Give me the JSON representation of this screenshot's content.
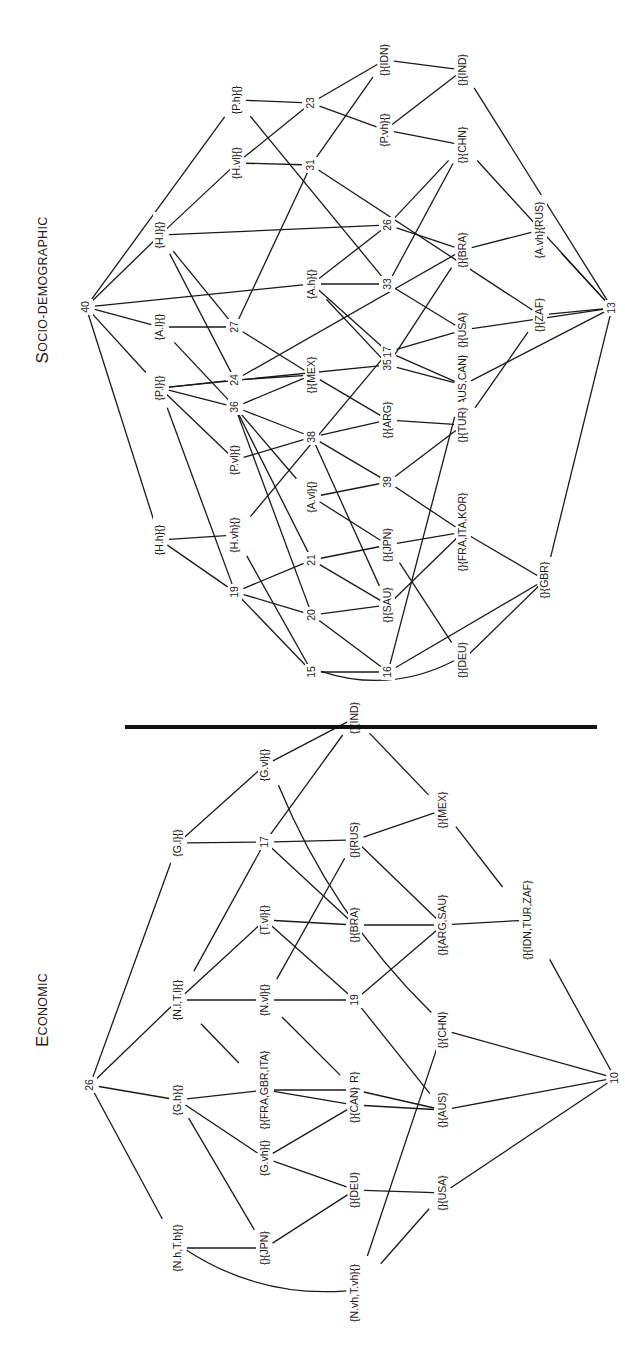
{
  "orientation": "rotated-90-ccw",
  "divider": {
    "x1": 125,
    "y1": 727,
    "x2": 597,
    "y2": 727
  },
  "diagrams": [
    {
      "id": "socio",
      "title": "Socio-demographic",
      "title_pos": [
        44,
        290
      ],
      "nodes": [
        {
          "id": "40",
          "label": "40",
          "x": 86,
          "y": 307
        },
        {
          "id": "Ph",
          "label": "{P.h}{}",
          "x": 237,
          "y": 100
        },
        {
          "id": "Hvl",
          "label": "{H.vl}{}",
          "x": 237,
          "y": 163
        },
        {
          "id": "Hl",
          "label": "{H.l}{}",
          "x": 160,
          "y": 235
        },
        {
          "id": "Al",
          "label": "{A.l}{}",
          "x": 160,
          "y": 327
        },
        {
          "id": "23",
          "label": "23",
          "x": 311,
          "y": 103
        },
        {
          "id": "31",
          "label": "31",
          "x": 311,
          "y": 165
        },
        {
          "id": "27",
          "label": "27",
          "x": 235,
          "y": 327
        },
        {
          "id": "24",
          "label": "24",
          "x": 235,
          "y": 380
        },
        {
          "id": "IDN",
          "label": "{}{IDN}",
          "x": 385,
          "y": 60
        },
        {
          "id": "Pvh",
          "label": "{P.vh}{}",
          "x": 385,
          "y": 130
        },
        {
          "id": "IND",
          "label": "{}{IND}",
          "x": 463,
          "y": 70
        },
        {
          "id": "CHN",
          "label": "{}{CHN}",
          "x": 463,
          "y": 145
        },
        {
          "id": "26",
          "label": "26",
          "x": 388,
          "y": 225
        },
        {
          "id": "Ah",
          "label": "{A.h}{}",
          "x": 312,
          "y": 284
        },
        {
          "id": "33",
          "label": "33",
          "x": 388,
          "y": 284
        },
        {
          "id": "BRA",
          "label": "{}{BRA}",
          "x": 463,
          "y": 250
        },
        {
          "id": "AvhRUS",
          "label": "{A.vh}{RUS}",
          "x": 540,
          "y": 230
        },
        {
          "id": "USA",
          "label": "{}{USA}",
          "x": 463,
          "y": 330
        },
        {
          "id": "ZAF",
          "label": "{}{ZAF}",
          "x": 540,
          "y": 315
        },
        {
          "id": "13",
          "label": "13",
          "x": 612,
          "y": 308
        },
        {
          "id": "MEX",
          "label": "{}{MEX}",
          "x": 312,
          "y": 375
        },
        {
          "id": "35",
          "label": "35",
          "x": 388,
          "y": 365
        },
        {
          "id": "17",
          "label": "17",
          "x": 388,
          "y": 352
        },
        {
          "id": "AUSCAN",
          "label": "{}{AUS,CAN}",
          "x": 463,
          "y": 385
        },
        {
          "id": "Pl",
          "label": "{P.l}{}",
          "x": 160,
          "y": 388
        },
        {
          "id": "36",
          "label": "36",
          "x": 235,
          "y": 407
        },
        {
          "id": "ARG",
          "label": "{}{ARG}",
          "x": 388,
          "y": 420
        },
        {
          "id": "TUR",
          "label": "{}{TUR}",
          "x": 463,
          "y": 425
        },
        {
          "id": "38",
          "label": "38",
          "x": 312,
          "y": 437
        },
        {
          "id": "Pvl",
          "label": "{P.vl}{}",
          "x": 235,
          "y": 460
        },
        {
          "id": "39",
          "label": "39",
          "x": 388,
          "y": 482
        },
        {
          "id": "Avl",
          "label": "{A.vl}{}",
          "x": 312,
          "y": 497
        },
        {
          "id": "Hh",
          "label": "{H.h}{}",
          "x": 160,
          "y": 540
        },
        {
          "id": "Hvh",
          "label": "{H.vh}{}",
          "x": 235,
          "y": 535
        },
        {
          "id": "JPN",
          "label": "{}{JPN}",
          "x": 388,
          "y": 545
        },
        {
          "id": "FIK",
          "label": "{}{FRA,ITA,KOR}",
          "x": 463,
          "y": 532
        },
        {
          "id": "21",
          "label": "21",
          "x": 312,
          "y": 560
        },
        {
          "id": "19",
          "label": "19",
          "x": 235,
          "y": 592
        },
        {
          "id": "GBR",
          "label": "{}{GBR}",
          "x": 545,
          "y": 580
        },
        {
          "id": "20",
          "label": "20",
          "x": 312,
          "y": 615
        },
        {
          "id": "SAU",
          "label": "{}{SAU}",
          "x": 388,
          "y": 605
        },
        {
          "id": "15",
          "label": "15",
          "x": 312,
          "y": 672
        },
        {
          "id": "16",
          "label": "16",
          "x": 388,
          "y": 672
        },
        {
          "id": "DEU",
          "label": "{}{DEU}",
          "x": 463,
          "y": 660
        }
      ],
      "edges": [
        [
          "40",
          "Ph"
        ],
        [
          "40",
          "Hl"
        ],
        [
          "40",
          "Al"
        ],
        [
          "40",
          "Ah"
        ],
        [
          "40",
          "Pl"
        ],
        [
          "40",
          "Hh"
        ],
        [
          "Hl",
          "Hvl"
        ],
        [
          "Hl",
          "26"
        ],
        [
          "Hl",
          "27"
        ],
        [
          "Hl",
          "24"
        ],
        [
          "Al",
          "27"
        ],
        [
          "Al",
          "36"
        ],
        [
          "Ph",
          "23"
        ],
        [
          "Ph",
          "33"
        ],
        [
          "Hvl",
          "23"
        ],
        [
          "Hvl",
          "31"
        ],
        [
          "23",
          "IDN"
        ],
        [
          "23",
          "Pvh"
        ],
        [
          "31",
          "IDN"
        ],
        [
          "31",
          "ZAF"
        ],
        [
          "27",
          "31"
        ],
        [
          "27",
          "MEX"
        ],
        [
          "24",
          "MEX"
        ],
        [
          "24",
          "BRA"
        ],
        [
          "24",
          "Pl"
        ],
        [
          "IDN",
          "IND"
        ],
        [
          "Pvh",
          "IND"
        ],
        [
          "Pvh",
          "CHN"
        ],
        [
          "26",
          "CHN"
        ],
        [
          "26",
          "BRA"
        ],
        [
          "26",
          "Ah"
        ],
        [
          "Ah",
          "33"
        ],
        [
          "Ah",
          "35"
        ],
        [
          "Ah",
          "17"
        ],
        [
          "33",
          "CHN"
        ],
        [
          "33",
          "USA"
        ],
        [
          "35",
          "BRA"
        ],
        [
          "35",
          "Pl"
        ],
        [
          "35",
          "AUSCAN"
        ],
        [
          "BRA",
          "AvhRUS"
        ],
        [
          "AvhRUS",
          "13"
        ],
        [
          "ZAF",
          "13"
        ],
        [
          "USA",
          "13"
        ],
        [
          "IND",
          "13"
        ],
        [
          "CHN",
          "13"
        ],
        [
          "AUSCAN",
          "13"
        ],
        [
          "GBR",
          "13"
        ],
        [
          "MEX",
          "36"
        ],
        [
          "MEX",
          "ARG"
        ],
        [
          "17",
          "AUSCAN"
        ],
        [
          "17",
          "USA"
        ],
        [
          "17",
          "Hvh"
        ],
        [
          "ZAF",
          "TUR"
        ],
        [
          "Pl",
          "36"
        ],
        [
          "Pl",
          "Pvl"
        ],
        [
          "Pl",
          "19"
        ],
        [
          "36",
          "38"
        ],
        [
          "36",
          "Avl"
        ],
        [
          "36",
          "21"
        ],
        [
          "36",
          "20"
        ],
        [
          "38",
          "Pvl"
        ],
        [
          "38",
          "ARG"
        ],
        [
          "38",
          "39"
        ],
        [
          "38",
          "SAU"
        ],
        [
          "ARG",
          "TUR"
        ],
        [
          "39",
          "Avl"
        ],
        [
          "39",
          "TUR"
        ],
        [
          "39",
          "FIK"
        ],
        [
          "Avl",
          "JPN"
        ],
        [
          "Hh",
          "Hvh"
        ],
        [
          "Hh",
          "19"
        ],
        [
          "Hvh",
          "15"
        ],
        [
          "JPN",
          "21"
        ],
        [
          "JPN",
          "FIK"
        ],
        [
          "JPN",
          "DEU"
        ],
        [
          "FIK",
          "SAU"
        ],
        [
          "FIK",
          "GBR"
        ],
        [
          "21",
          "19"
        ],
        [
          "21",
          "SAU"
        ],
        [
          "19",
          "20"
        ],
        [
          "19",
          "15"
        ],
        [
          "20",
          "SAU"
        ],
        [
          "20",
          "16"
        ],
        [
          "15",
          "16"
        ],
        [
          "15",
          "DEU",
          "curve"
        ],
        [
          "16",
          "AUSCAN"
        ],
        [
          "16",
          "GBR"
        ],
        [
          "DEU",
          "GBR"
        ]
      ]
    },
    {
      "id": "economic",
      "title": "Economic",
      "title_pos": [
        44,
        1010
      ],
      "nodes": [
        {
          "id": "26",
          "label": "26",
          "x": 90,
          "y": 1085
        },
        {
          "id": "Gl",
          "label": "{G.l}{}",
          "x": 178,
          "y": 843
        },
        {
          "id": "Gvl",
          "label": "{G.vl}{}",
          "x": 265,
          "y": 765
        },
        {
          "id": "17",
          "label": "17",
          "x": 265,
          "y": 842
        },
        {
          "id": "IND",
          "label": "{}{IND}",
          "x": 355,
          "y": 718
        },
        {
          "id": "RUS",
          "label": "{}{RUS}",
          "x": 355,
          "y": 840
        },
        {
          "id": "MEX",
          "label": "{}{MEX}",
          "x": 443,
          "y": 810
        },
        {
          "id": "Tvl",
          "label": "{T.vl}{}",
          "x": 265,
          "y": 920
        },
        {
          "id": "BRA",
          "label": "{}{BRA}",
          "x": 355,
          "y": 925
        },
        {
          "id": "ARGSAU",
          "label": "{}{ARG,SAU}",
          "x": 443,
          "y": 925
        },
        {
          "id": "ITZ",
          "label": "{}{IDN,TUR,ZAF}",
          "x": 528,
          "y": 920
        },
        {
          "id": "NlTl",
          "label": "{N.l,T.l}{}",
          "x": 178,
          "y": 1000
        },
        {
          "id": "Nvl",
          "label": "{N.vl}{}",
          "x": 265,
          "y": 1000
        },
        {
          "id": "19",
          "label": "19",
          "x": 355,
          "y": 1000
        },
        {
          "id": "CHN",
          "label": "{}{CHN}",
          "x": 443,
          "y": 1030
        },
        {
          "id": "10",
          "label": "10",
          "x": 615,
          "y": 1078
        },
        {
          "id": "KOR",
          "label": "{}{KOR}",
          "x": 355,
          "y": 1090
        },
        {
          "id": "AUS",
          "label": "{}{AUS}",
          "x": 443,
          "y": 1110
        },
        {
          "id": "FGI",
          "label": "{}{FRA,GBR,ITA}",
          "x": 265,
          "y": 1090
        },
        {
          "id": "Gh",
          "label": "{G.h}{}",
          "x": 178,
          "y": 1100
        },
        {
          "id": "CAN",
          "label": "{}{CAN}",
          "x": 355,
          "y": 1105
        },
        {
          "id": "Gvh",
          "label": "{G.vh}{}",
          "x": 265,
          "y": 1158
        },
        {
          "id": "DEU",
          "label": "{}{DEU}",
          "x": 355,
          "y": 1190
        },
        {
          "id": "USA",
          "label": "{}{USA}",
          "x": 443,
          "y": 1193
        },
        {
          "id": "NhTh",
          "label": "{N.h,T.h}{}",
          "x": 178,
          "y": 1248
        },
        {
          "id": "JPN",
          "label": "{}{JPN}",
          "x": 265,
          "y": 1248
        },
        {
          "id": "NvhTvh",
          "label": "{N.vh,T.vh}{}",
          "x": 355,
          "y": 1293
        }
      ],
      "edges": [
        [
          "26",
          "Gl"
        ],
        [
          "26",
          "NlTl"
        ],
        [
          "26",
          "Gh"
        ],
        [
          "26",
          "NhTh"
        ],
        [
          "Gl",
          "Gvl"
        ],
        [
          "Gl",
          "17"
        ],
        [
          "Gvl",
          "IND"
        ],
        [
          "Gvl",
          "CHN",
          "curve"
        ],
        [
          "17",
          "IND"
        ],
        [
          "17",
          "RUS"
        ],
        [
          "17",
          "BRA"
        ],
        [
          "17",
          "NlTl"
        ],
        [
          "IND",
          "MEX"
        ],
        [
          "RUS",
          "MEX"
        ],
        [
          "RUS",
          "ARGSAU"
        ],
        [
          "RUS",
          "Nvl"
        ],
        [
          "MEX",
          "ITZ"
        ],
        [
          "NlTl",
          "Tvl"
        ],
        [
          "NlTl",
          "Nvl"
        ],
        [
          "NlTl",
          "FGI"
        ],
        [
          "Tvl",
          "BRA"
        ],
        [
          "Tvl",
          "19"
        ],
        [
          "BRA",
          "ARGSAU"
        ],
        [
          "ARGSAU",
          "ITZ"
        ],
        [
          "ARGSAU",
          "19"
        ],
        [
          "ITZ",
          "10"
        ],
        [
          "Nvl",
          "19"
        ],
        [
          "Nvl",
          "KOR"
        ],
        [
          "19",
          "AUS"
        ],
        [
          "CHN",
          "10"
        ],
        [
          "CHN",
          "NvhTvh"
        ],
        [
          "AUS",
          "10"
        ],
        [
          "USA",
          "10"
        ],
        [
          "KOR",
          "FGI"
        ],
        [
          "KOR",
          "AUS"
        ],
        [
          "FGI",
          "Gh"
        ],
        [
          "FGI",
          "CAN"
        ],
        [
          "CAN",
          "AUS"
        ],
        [
          "CAN",
          "Gvh"
        ],
        [
          "Gh",
          "Gvh"
        ],
        [
          "Gh",
          "JPN"
        ],
        [
          "Gvh",
          "DEU"
        ],
        [
          "DEU",
          "USA"
        ],
        [
          "DEU",
          "JPN"
        ],
        [
          "USA",
          "NvhTvh"
        ],
        [
          "NhTh",
          "JPN"
        ],
        [
          "NhTh",
          "NvhTvh",
          "curve"
        ]
      ]
    }
  ]
}
